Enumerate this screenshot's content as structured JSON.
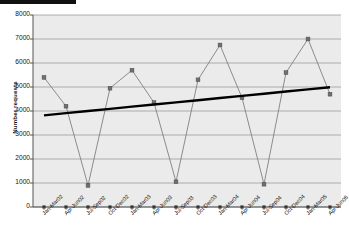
{
  "chart_data": {
    "type": "line",
    "title": "",
    "subtitle": "",
    "xlabel": "",
    "ylabel": "Number requests",
    "ylim": [
      0,
      8000
    ],
    "ytick_step": 1000,
    "yticks": [
      "8000",
      "7000",
      "6000",
      "5000",
      "4000",
      "3000",
      "2000",
      "1000",
      "0"
    ],
    "grid": true,
    "grid_orientation": "horizontal",
    "legend": false,
    "legend_position": "none",
    "plot_background": "#ebebeb",
    "categories": [
      "Jan-Mar02",
      "Apr-Jun02",
      "Jul-Sep02",
      "Oct-Dec02",
      "Jan-Mar03",
      "Apr-Jun03",
      "Jul-Sep03",
      "Oct-Dec03",
      "Jan-Mar04",
      "Apr-Jun04",
      "Jul-Sep04",
      "Oct-Dec04",
      "Jan-Mar05",
      "Apr-Jun05"
    ],
    "series": [
      {
        "name": "Number requests",
        "type": "line",
        "color": "#808080",
        "marker": "square",
        "marker_color": "#6e6e6e",
        "values": [
          5400,
          4200,
          900,
          4950,
          5700,
          4350,
          1050,
          5300,
          6750,
          4550,
          950,
          5600,
          7000,
          4700
        ]
      },
      {
        "name": "Linear trend",
        "type": "trendline",
        "color": "#000000",
        "marker": "none",
        "values": [
          3820,
          3910,
          4000,
          4090,
          4180,
          4270,
          4360,
          4450,
          4540,
          4630,
          4720,
          4810,
          4900,
          4990
        ]
      }
    ],
    "annotations": []
  },
  "artifacts": {
    "redaction_bar_label": ""
  }
}
